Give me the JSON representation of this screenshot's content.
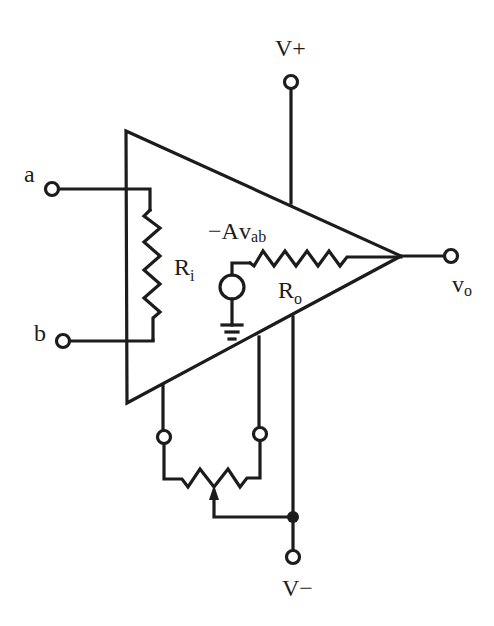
{
  "diagram": {
    "labels": {
      "v_plus": "V+",
      "v_minus": "V−",
      "input_a": "a",
      "input_b": "b",
      "output_main": "v",
      "output_sub": "o",
      "ri_main": "R",
      "ri_sub": "i",
      "ro_main": "R",
      "ro_sub": "o",
      "source_prefix": "−A",
      "source_v": "v",
      "source_sub": "ab"
    },
    "components": [
      {
        "name": "op-amp-triangle",
        "type": "amplifier"
      },
      {
        "name": "input-resistance",
        "type": "resistor",
        "label": "Ri"
      },
      {
        "name": "output-resistance",
        "type": "resistor",
        "label": "Ro"
      },
      {
        "name": "dependent-voltage-source",
        "type": "voltage-source",
        "label": "-Av_ab"
      },
      {
        "name": "ground",
        "type": "ground"
      },
      {
        "name": "offset-null-potentiometer",
        "type": "potentiometer"
      }
    ],
    "terminals": [
      "a",
      "b",
      "vo",
      "V+",
      "V-",
      "null-1",
      "null-2"
    ],
    "colors": {
      "ink": "#1c1c1c",
      "background": "#ffffff"
    }
  }
}
